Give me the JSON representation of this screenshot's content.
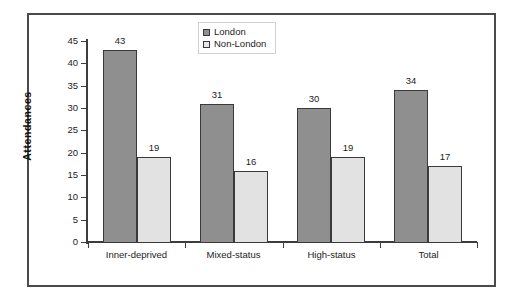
{
  "chart_data": {
    "type": "bar",
    "title": "",
    "xlabel": "",
    "ylabel": "Attendances",
    "ylim": [
      0,
      45
    ],
    "ytick_step": 5,
    "yticks": [
      "0",
      "5",
      "10",
      "15",
      "20",
      "25",
      "30",
      "35",
      "40",
      "45"
    ],
    "grid": false,
    "legend_position": "top-center",
    "categories": [
      "Inner-deprived",
      "Mixed-status",
      "High-status",
      "Total"
    ],
    "series": [
      {
        "name": "London",
        "color": "#8f8f8f",
        "values": [
          43,
          31,
          30,
          34
        ]
      },
      {
        "name": "Non-London",
        "color": "#e2e2e2",
        "values": [
          19,
          16,
          19,
          17
        ]
      }
    ],
    "data_labels": {
      "Inner-deprived": {
        "London": "43",
        "Non-London": "19"
      },
      "Mixed-status": {
        "London": "31",
        "Non-London": "16"
      },
      "High-status": {
        "London": "30",
        "Non-London": "19"
      },
      "Total": {
        "London": "34",
        "Non-London": "17"
      }
    },
    "legend": [
      {
        "label": "London",
        "swatch": "#8f8f8f"
      },
      {
        "label": "Non-London",
        "swatch": "#e8e8e8"
      }
    ]
  },
  "figure": {
    "border_color": "#4a4a4a",
    "axis_color": "#3d3d3d",
    "background": "#ffffff"
  }
}
